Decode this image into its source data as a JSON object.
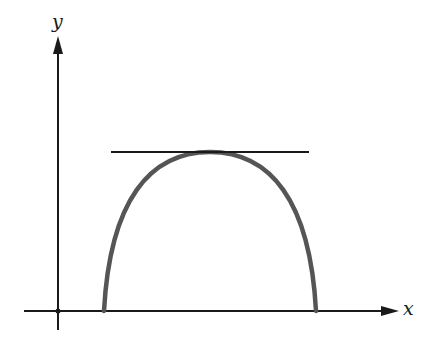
{
  "diagram": {
    "axes": {
      "x_label": "x",
      "y_label": "y",
      "axis_color": "#1a1a1a"
    },
    "curve": {
      "shape": "downward parabola-like arch",
      "color": "#555555",
      "left_root_px": [
        104,
        311
      ],
      "vertex_px": [
        210,
        152
      ],
      "right_root_px": [
        316,
        311
      ]
    },
    "tangent_line": {
      "description": "horizontal tangent at maximum",
      "color": "#1a1a1a",
      "from_px": [
        111,
        152
      ],
      "to_px": [
        309,
        152
      ]
    }
  }
}
